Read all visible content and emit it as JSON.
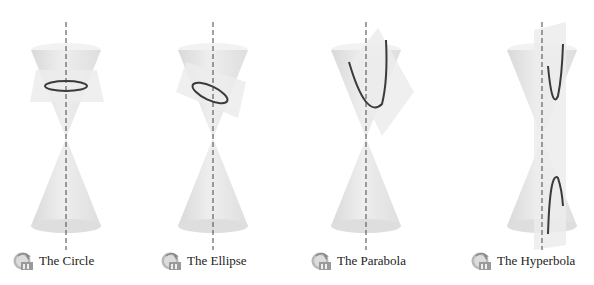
{
  "figure": {
    "panels": [
      {
        "id": "circle",
        "label": "The Circle",
        "icon": "animation-icon"
      },
      {
        "id": "ellipse",
        "label": "The Ellipse",
        "icon": "animation-icon"
      },
      {
        "id": "parabola",
        "label": "The Parabola",
        "icon": "animation-icon"
      },
      {
        "id": "hyperbola",
        "label": "The Hyperbola",
        "icon": "animation-icon"
      }
    ],
    "colors": {
      "cone_fill": "#e6e6e6",
      "cone_shadow": "#d2d2d2",
      "plane_fill": "#ececec",
      "curve": "#3a3a3a",
      "axis": "#444444"
    }
  }
}
